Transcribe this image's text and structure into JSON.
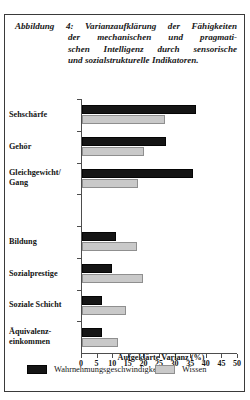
{
  "caption": {
    "label": "Abbildung 4:",
    "line1": "Varianzaufklärung der Fähigkeiten",
    "line2": "der mechanischen und pragmati-",
    "line3": "schen Intelligenz durch sensorische",
    "line4": "und sozialstrukturelle Indikatoren."
  },
  "chart_data": {
    "type": "bar",
    "orientation": "horizontal",
    "xlabel": "Aufgeklärte Varianz (%)",
    "ylabel": "",
    "xlim": [
      0,
      50
    ],
    "xticks": [
      0,
      5,
      10,
      15,
      20,
      25,
      30,
      35,
      40,
      45,
      50
    ],
    "xticklabels": [
      "0",
      "5",
      "10",
      "15",
      "20",
      "25",
      "30",
      "35",
      "40",
      "45",
      "50"
    ],
    "grid": false,
    "legend_position": "bottom",
    "categories": [
      "Sehschärfe",
      "Gehör",
      "Gleichgewicht/ Gang",
      "",
      "Bildung",
      "Sozialprestige",
      "Soziale Schicht",
      "Äquivalenz- einkommen"
    ],
    "category_labels": [
      {
        "line1": "Sehschärfe",
        "line2": ""
      },
      {
        "line1": "Gehör",
        "line2": ""
      },
      {
        "line1": "Gleichgewicht/",
        "line2": "Gang"
      },
      {
        "line1": "",
        "line2": ""
      },
      {
        "line1": "Bildung",
        "line2": ""
      },
      {
        "line1": "Sozialprestige",
        "line2": ""
      },
      {
        "line1": "Soziale Schicht",
        "line2": ""
      },
      {
        "line1": "Äquivalenz-",
        "line2": "einkommen"
      }
    ],
    "series": [
      {
        "name": "Wahrnehmungsgeschwindigkeit",
        "color": "#151515",
        "values": [
          36.5,
          27.0,
          35.5,
          null,
          11.0,
          9.7,
          6.5,
          6.5
        ]
      },
      {
        "name": "Wissen",
        "color": "#c9c9c9",
        "values": [
          26.5,
          20.0,
          18.0,
          null,
          17.5,
          19.5,
          14.0,
          11.5
        ]
      }
    ]
  },
  "legend": {
    "items": [
      {
        "label": "Wahrnehmungsgeschwindigkeit",
        "color": "#151515"
      },
      {
        "label": "Wissen",
        "color": "#c9c9c9"
      }
    ]
  }
}
